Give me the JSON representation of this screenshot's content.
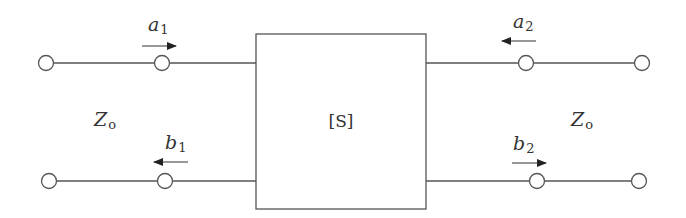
{
  "diagram": {
    "box_label": "[S]",
    "impedance_left": {
      "main": "Z",
      "sub": "o"
    },
    "impedance_right": {
      "main": "Z",
      "sub": "o"
    },
    "waves": [
      {
        "id": "a1",
        "main": "a",
        "sub": "1",
        "direction": "right"
      },
      {
        "id": "b1",
        "main": "b",
        "sub": "1",
        "direction": "left"
      },
      {
        "id": "a2",
        "main": "a",
        "sub": "2",
        "direction": "left"
      },
      {
        "id": "b2",
        "main": "b",
        "sub": "2",
        "direction": "right"
      }
    ],
    "colors": {
      "line": "#555555",
      "text": "#333333"
    }
  }
}
